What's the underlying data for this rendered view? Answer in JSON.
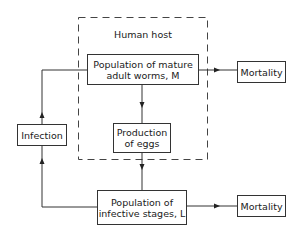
{
  "diagram": {
    "container_label": "Human host",
    "nodes": {
      "adult_worms": "Population of mature adult worms, M",
      "adult_worms_line1": "Population of mature",
      "adult_worms_line2": "adult worms, M",
      "eggs_line1": "Production",
      "eggs_line2": "of eggs",
      "infection": "Infection",
      "infective_line1": "Population of",
      "infective_line2": "infective stages, L",
      "mortality_top": "Mortality",
      "mortality_bottom": "Mortality"
    },
    "edges": [
      {
        "from": "adult_worms",
        "to": "mortality_top"
      },
      {
        "from": "adult_worms",
        "to": "eggs"
      },
      {
        "from": "eggs",
        "to": "infective_stages"
      },
      {
        "from": "infective_stages",
        "to": "mortality_bottom"
      },
      {
        "from": "infective_stages",
        "to": "infection"
      },
      {
        "from": "infection",
        "to": "adult_worms"
      }
    ]
  }
}
